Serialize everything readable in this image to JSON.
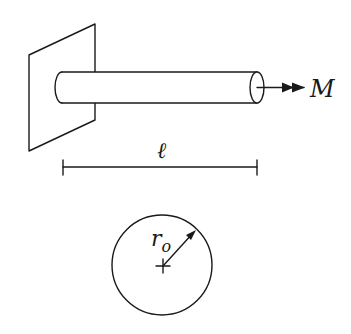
{
  "figure": {
    "type": "cantilever rod under axial moment",
    "labels": {
      "moment": "M",
      "length": "ℓ",
      "radius_main": "r",
      "radius_sub": "o"
    },
    "colors": {
      "ink": "#1a1a1a",
      "background": "#ffffff"
    }
  }
}
